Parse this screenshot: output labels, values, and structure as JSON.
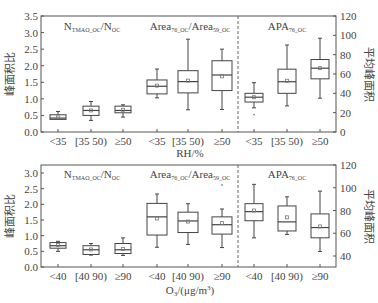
{
  "chart_data": [
    {
      "type": "box",
      "panel": "top",
      "xlabel": "RH/%",
      "ylabel_left": "峰面积比",
      "ylabel_right": "平均峰面积",
      "ylim_left": [
        0,
        3.5
      ],
      "yticks_left": [
        "0.0",
        "0.5",
        "1.0",
        "1.5",
        "2.0",
        "2.5",
        "3.0",
        "3.5"
      ],
      "ylim_right": [
        0,
        120
      ],
      "yticks_right": [
        "0",
        "20",
        "40",
        "60",
        "80",
        "100",
        "120"
      ],
      "groups": [
        {
          "title_main": "N",
          "title_sub": "TMAO_OC",
          "title_main2": "/N",
          "title_sub2": "OC",
          "axis": "left",
          "categories": [
            "<35",
            "[35 50)",
            "≥50"
          ],
          "boxes": [
            {
              "min": 0.38,
              "q1": 0.38,
              "median": 0.42,
              "q3": 0.52,
              "max": 0.62,
              "mean": 0.44
            },
            {
              "min": 0.35,
              "q1": 0.5,
              "median": 0.65,
              "q3": 0.78,
              "max": 0.92,
              "mean": 0.65
            },
            {
              "min": 0.45,
              "q1": 0.58,
              "median": 0.65,
              "q3": 0.78,
              "max": 0.82,
              "mean": 0.67
            }
          ]
        },
        {
          "title_main": "Area",
          "title_sub": "76_OC",
          "title_main2": "/Area",
          "title_sub2": "59_OC",
          "axis": "left",
          "categories": [
            "<35",
            "[35 50)",
            "≥50"
          ],
          "boxes": [
            {
              "min": 1.03,
              "q1": 1.15,
              "median": 1.38,
              "q3": 1.57,
              "max": 1.9,
              "mean": 1.4
            },
            {
              "min": 0.67,
              "q1": 1.18,
              "median": 1.52,
              "q3": 1.85,
              "max": 2.8,
              "mean": 1.55
            },
            {
              "min": 0.68,
              "q1": 1.25,
              "median": 1.72,
              "q3": 2.15,
              "max": 2.5,
              "mean": 1.68
            }
          ]
        },
        {
          "title_main": "APA",
          "title_sub": "76_OC",
          "title_main2": "",
          "title_sub2": "",
          "axis": "right",
          "categories": [
            "<35",
            "[35 50)",
            "≥50"
          ],
          "boxes": [
            {
              "min": 25,
              "q1": 31,
              "median": 36,
              "q3": 40,
              "max": 51,
              "mean": 36,
              "outliers": [
                18
              ]
            },
            {
              "min": 27,
              "q1": 40,
              "median": 52,
              "q3": 65,
              "max": 90,
              "mean": 53
            },
            {
              "min": 35,
              "q1": 55,
              "median": 66,
              "q3": 75,
              "max": 97,
              "mean": 66
            }
          ]
        }
      ]
    },
    {
      "type": "box",
      "panel": "bottom",
      "xlabel_main": "O",
      "xlabel_sub": "3",
      "xlabel_rest": "/(μg/m",
      "xlabel_sup": "3",
      "xlabel_end": ")",
      "ylabel_left": "峰面积比",
      "ylabel_right": "平均峰面积",
      "ylim_left": [
        0,
        3.25
      ],
      "yticks_left": [
        "0.0",
        "0.5",
        "1.0",
        "1.5",
        "2.0",
        "2.5",
        "3.0"
      ],
      "ylim_right": [
        30,
        120
      ],
      "yticks_right": [
        "40",
        "60",
        "80",
        "100",
        "120"
      ],
      "groups": [
        {
          "title_main": "N",
          "title_sub": "TMAO_OC",
          "title_main2": "/N",
          "title_sub2": "OC",
          "axis": "left",
          "categories": [
            "<40",
            "[40 90)",
            "≥90"
          ],
          "boxes": [
            {
              "min": 0.5,
              "q1": 0.6,
              "median": 0.68,
              "q3": 0.78,
              "max": 0.82,
              "mean": 0.7
            },
            {
              "min": 0.38,
              "q1": 0.4,
              "median": 0.55,
              "q3": 0.68,
              "max": 0.75,
              "mean": 0.56
            },
            {
              "min": 0.37,
              "q1": 0.43,
              "median": 0.55,
              "q3": 0.75,
              "max": 0.93,
              "mean": 0.58
            }
          ]
        },
        {
          "title_main": "Area",
          "title_sub": "76_OC",
          "title_main2": "/Area",
          "title_sub2": "59_OC",
          "axis": "left",
          "categories": [
            "<40",
            "[40 90)",
            "≥90"
          ],
          "boxes": [
            {
              "min": 0.63,
              "q1": 1.02,
              "median": 1.6,
              "q3": 2.03,
              "max": 2.33,
              "mean": 1.55
            },
            {
              "min": 0.72,
              "q1": 1.1,
              "median": 1.47,
              "q3": 1.75,
              "max": 2.02,
              "mean": 1.45
            },
            {
              "min": 0.62,
              "q1": 1.05,
              "median": 1.35,
              "q3": 1.6,
              "max": 1.85,
              "mean": 1.4,
              "outliers": [
                2.62
              ]
            }
          ]
        },
        {
          "title_main": "APA",
          "title_sub": "76_OC",
          "title_main2": "",
          "title_sub2": "",
          "axis": "right",
          "categories": [
            "<40",
            "[40 90)",
            "≥90"
          ],
          "boxes": [
            {
              "min": 56,
              "q1": 71,
              "median": 79,
              "q3": 86,
              "max": 103,
              "mean": 80
            },
            {
              "min": 59,
              "q1": 62,
              "median": 70,
              "q3": 84,
              "max": 92,
              "mean": 74
            },
            {
              "min": 44,
              "q1": 56,
              "median": 65,
              "q3": 77,
              "max": 97,
              "mean": 66
            }
          ]
        }
      ]
    }
  ]
}
